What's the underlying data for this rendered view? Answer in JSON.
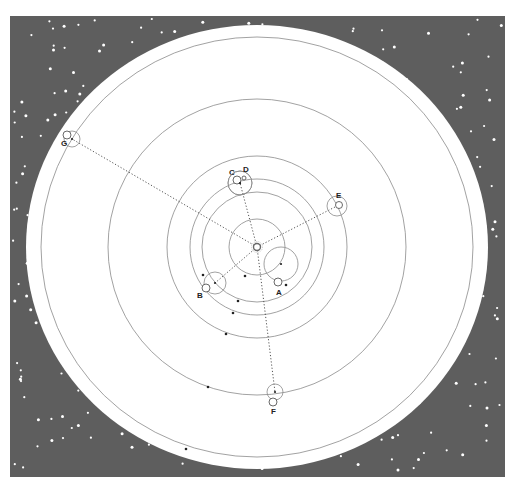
{
  "diagram": {
    "type": "orbital-diagram",
    "colors": {
      "space": "#5e5e5e",
      "star": "#ffffff",
      "disk": "#ffffff",
      "orbit": "#8a8a8a",
      "ray": "#555555",
      "dot": "#222222",
      "label": "#222222"
    },
    "center": {
      "x": 257,
      "y": 247
    },
    "sun": {
      "r": 3.5
    },
    "disk": {
      "rx": 231,
      "ry": 222
    },
    "orbits": [
      {
        "rx": 28,
        "ry": 28
      },
      {
        "rx": 55,
        "ry": 55
      },
      {
        "rx": 67,
        "ry": 68
      },
      {
        "rx": 90,
        "ry": 91
      },
      {
        "rx": 149,
        "ry": 148
      },
      {
        "rx": 216,
        "ry": 210
      }
    ],
    "planets": [
      {
        "label": "A",
        "cx": 281,
        "cy": 264,
        "r": 17,
        "moon": {
          "cx": 278,
          "cy": 282,
          "r": 4
        },
        "label_x": 276,
        "label_y": 295,
        "ray": false
      },
      {
        "label": "B",
        "cx": 215,
        "cy": 283,
        "r": 11,
        "moon": {
          "cx": 206,
          "cy": 288,
          "r": 4
        },
        "label_x": 197,
        "label_y": 298,
        "ray": true
      },
      {
        "label": "C",
        "cx": 240,
        "cy": 183,
        "r": 12,
        "moon": {
          "cx": 237,
          "cy": 180,
          "r": 4
        },
        "label_x": 229,
        "label_y": 175,
        "ray": true
      },
      {
        "label": "D",
        "cx": 240,
        "cy": 183,
        "r": 12,
        "moon": {
          "cx": 244,
          "cy": 178,
          "r": 2
        },
        "label_x": 243,
        "label_y": 172,
        "ray": false
      },
      {
        "label": "E",
        "cx": 337,
        "cy": 206,
        "r": 10,
        "moon": {
          "cx": 339,
          "cy": 205,
          "r": 3.5
        },
        "label_x": 336,
        "label_y": 198,
        "ray": true
      },
      {
        "label": "F",
        "cx": 275,
        "cy": 392,
        "r": 8,
        "moon": {
          "cx": 273,
          "cy": 402,
          "r": 4
        },
        "label_x": 271,
        "label_y": 414,
        "ray": true
      },
      {
        "label": "G",
        "cx": 72,
        "cy": 139,
        "r": 8,
        "moon": {
          "cx": 67,
          "cy": 135,
          "r": 4
        },
        "label_x": 61,
        "label_y": 146,
        "ray": true
      }
    ],
    "dots": [
      {
        "x": 245,
        "y": 276
      },
      {
        "x": 238,
        "y": 301
      },
      {
        "x": 233,
        "y": 313
      },
      {
        "x": 226,
        "y": 334
      },
      {
        "x": 208,
        "y": 387
      },
      {
        "x": 186,
        "y": 449
      },
      {
        "x": 203,
        "y": 275
      },
      {
        "x": 286,
        "y": 285
      }
    ],
    "space_rect": {
      "x": 10,
      "y": 16,
      "w": 495,
      "h": 461
    }
  }
}
